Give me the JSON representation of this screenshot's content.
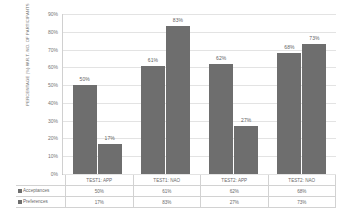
{
  "chart_data": {
    "type": "bar",
    "title": "",
    "subtitle": "",
    "xlabel": "",
    "ylabel": "PERCENTAGE (%) W.R.T. NO. OF PARTICIPANTS",
    "categories": [
      "TEST1: APP",
      "TEST1: NAO",
      "TEST2: APP",
      "TEST2: NAO"
    ],
    "series": [
      {
        "name": "Acceptances",
        "values": [
          50,
          61,
          62,
          68
        ],
        "value_labels": [
          "50%",
          "61%",
          "62%",
          "68%"
        ]
      },
      {
        "name": "Preferences",
        "values": [
          17,
          83,
          27,
          73
        ],
        "value_labels": [
          "17%",
          "83%",
          "27%",
          "73%"
        ]
      }
    ],
    "ylim": [
      0,
      90
    ],
    "yticks": [
      0,
      10,
      20,
      30,
      40,
      50,
      60,
      70,
      80,
      90
    ],
    "ytick_labels": [
      "0%",
      "10%",
      "20%",
      "30%",
      "40%",
      "50%",
      "60%",
      "70%",
      "80%",
      "90%"
    ],
    "grid": true,
    "legend_position": "data-table-below",
    "bar_color": "#6e6e6e",
    "grid_color": "#e3e3e3"
  },
  "table": {
    "headers": [
      "TEST1: APP",
      "TEST1: NAO",
      "TEST2: APP",
      "TEST2: NAO"
    ],
    "rows": [
      {
        "label": "Acceptances",
        "values": [
          "50%",
          "61%",
          "62%",
          "68%"
        ]
      },
      {
        "label": "Preferences",
        "values": [
          "17%",
          "83%",
          "27%",
          "73%"
        ]
      }
    ]
  }
}
